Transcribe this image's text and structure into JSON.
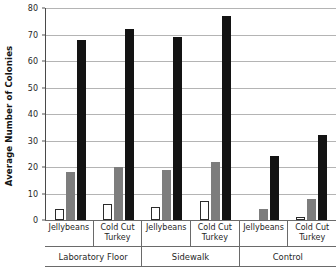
{
  "chart_data": {
    "type": "bar",
    "title": "",
    "xlabel": "",
    "ylabel": "Average Number of Colonies",
    "ylim": [
      0,
      80
    ],
    "yticks": [
      0,
      10,
      20,
      30,
      40,
      50,
      60,
      70,
      80
    ],
    "ytick_labels": [
      "0",
      "10",
      "20",
      "30",
      "40",
      "50",
      "60",
      "70",
      "80"
    ],
    "grid": true,
    "legend": "none",
    "group_labels": [
      "Laboratory Floor",
      "Sidewalk",
      "Control"
    ],
    "categories": [
      "Jellybeans",
      "Cold Cut Turkey",
      "Jellybeans",
      "Cold Cut Turkey",
      "Jellybeans",
      "Cold Cut Turkey"
    ],
    "series": [
      {
        "name": "white",
        "color": "#ffffff",
        "values": [
          4,
          6,
          5,
          7,
          0,
          1
        ]
      },
      {
        "name": "gray",
        "color": "#7d7d7d",
        "values": [
          18,
          20,
          19,
          22,
          4,
          8
        ]
      },
      {
        "name": "black",
        "color": "#131313",
        "values": [
          68,
          72,
          69,
          77,
          24,
          32
        ]
      }
    ],
    "groups": [
      {
        "label": "Laboratory Floor",
        "subgroups": [
          {
            "label": "Jellybeans",
            "bars": [
              4,
              18,
              68
            ]
          },
          {
            "label": "Cold Cut Turkey",
            "bars": [
              6,
              20,
              72
            ]
          }
        ]
      },
      {
        "label": "Sidewalk",
        "subgroups": [
          {
            "label": "Jellybeans",
            "bars": [
              5,
              19,
              69
            ]
          },
          {
            "label": "Cold Cut Turkey",
            "bars": [
              7,
              22,
              77
            ]
          }
        ]
      },
      {
        "label": "Control",
        "subgroups": [
          {
            "label": "Jellybeans",
            "bars": [
              0,
              4,
              24
            ]
          },
          {
            "label": "Cold Cut Turkey",
            "bars": [
              1,
              8,
              32
            ]
          }
        ]
      }
    ]
  }
}
